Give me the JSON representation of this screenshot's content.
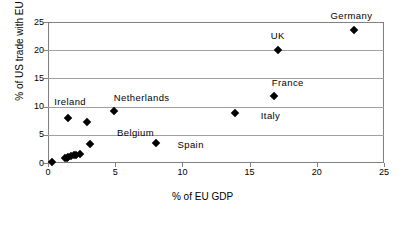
{
  "chart_data": {
    "type": "scatter",
    "title": "",
    "xlabel": "% of EU GDP",
    "ylabel": "% of US trade with EU",
    "xlim": [
      0,
      25
    ],
    "ylim": [
      0,
      25
    ],
    "xticks": [
      0,
      5,
      10,
      15,
      20,
      25
    ],
    "yticks": [
      0,
      5,
      10,
      15,
      20,
      25
    ],
    "xtick_labels": [
      "0",
      "5",
      "10",
      "15",
      "20",
      "25"
    ],
    "ytick_labels": [
      "0",
      "5",
      "10",
      "15",
      "20",
      "25"
    ],
    "grid": "horizontal",
    "legend": "none",
    "marker": "diamond",
    "marker_color": "#000000",
    "frame_color": "#808080",
    "gridline_color": "#a0a0a0",
    "points": [
      {
        "label": "Germany",
        "x": 22.8,
        "y": 23.6,
        "label_dx": -3,
        "label_dy": -14,
        "label_anchor": "center"
      },
      {
        "label": "UK",
        "x": 17.1,
        "y": 20.0,
        "label_dx": 0,
        "label_dy": -14,
        "label_anchor": "center"
      },
      {
        "label": "France",
        "x": 16.8,
        "y": 11.8,
        "label_dx": 14,
        "label_dy": -13,
        "label_anchor": "center"
      },
      {
        "label": "Italy",
        "x": 13.9,
        "y": 8.9,
        "label_dx": 26,
        "label_dy": 3,
        "label_anchor": "start"
      },
      {
        "label": "Netherlands",
        "x": 4.9,
        "y": 9.2,
        "label_dx": 28,
        "label_dy": -13,
        "label_anchor": "center"
      },
      {
        "label": "Ireland",
        "x": 1.5,
        "y": 8.0,
        "label_dx": 2,
        "label_dy": -16,
        "label_anchor": "center"
      },
      {
        "label": "Belgium",
        "x": 2.9,
        "y": 7.2,
        "label_dx": 30,
        "label_dy": 11,
        "label_anchor": "start"
      },
      {
        "label": "Spain",
        "x": 8.0,
        "y": 3.5,
        "label_dx": 22,
        "label_dy": 2,
        "label_anchor": "start"
      },
      {
        "label": "",
        "x": 3.1,
        "y": 3.4,
        "label_dx": 0,
        "label_dy": 0,
        "label_anchor": "start"
      },
      {
        "label": "",
        "x": 2.4,
        "y": 1.6,
        "label_dx": 0,
        "label_dy": 0,
        "label_anchor": "start"
      },
      {
        "label": "",
        "x": 2.1,
        "y": 1.5,
        "label_dx": 0,
        "label_dy": 0,
        "label_anchor": "start"
      },
      {
        "label": "",
        "x": 1.9,
        "y": 1.4,
        "label_dx": 0,
        "label_dy": 0,
        "label_anchor": "start"
      },
      {
        "label": "",
        "x": 1.7,
        "y": 1.2,
        "label_dx": 0,
        "label_dy": 0,
        "label_anchor": "start"
      },
      {
        "label": "",
        "x": 1.5,
        "y": 1.1,
        "label_dx": 0,
        "label_dy": 0,
        "label_anchor": "start"
      },
      {
        "label": "",
        "x": 1.4,
        "y": 0.9,
        "label_dx": 0,
        "label_dy": 0,
        "label_anchor": "start"
      },
      {
        "label": "",
        "x": 1.3,
        "y": 0.8,
        "label_dx": 0,
        "label_dy": 0,
        "label_anchor": "start"
      },
      {
        "label": "",
        "x": 0.3,
        "y": 0.2,
        "label_dx": 0,
        "label_dy": 0,
        "label_anchor": "start"
      }
    ]
  }
}
